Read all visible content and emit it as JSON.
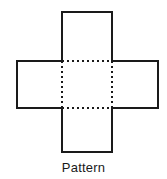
{
  "figure": {
    "title": "Pattern",
    "colors": {
      "background": "#ffffff",
      "outline": "#1a1a1a",
      "dashed": "#1a1a1a",
      "face_fill": "#ffffff",
      "caption_text": "#1a1a1a"
    },
    "stroke": {
      "outline_width": 2,
      "dashed_width": 2,
      "dash_pattern": "2 3"
    },
    "geometry": {
      "top_square": {
        "x": 62,
        "y": 12,
        "width": 50,
        "height": 49
      },
      "left_square": {
        "x": 17,
        "y": 61,
        "width": 45,
        "height": 47
      },
      "center_square": {
        "x": 62,
        "y": 61,
        "width": 50,
        "height": 47
      },
      "right_square": {
        "x": 112,
        "y": 61,
        "width": 46,
        "height": 47
      },
      "bottom_square": {
        "x": 62,
        "y": 108,
        "width": 50,
        "height": 44
      }
    },
    "outline_path": "M 62 12 L 112 12 L 112 61 L 158 61 L 158 108 L 112 108 L 112 152 L 62 152 L 62 108 L 17 108 L 17 61 L 62 61 Z",
    "dashed_segments": [
      {
        "name": "center-top-fold",
        "x1": 62,
        "y1": 61,
        "x2": 112,
        "y2": 61
      },
      {
        "name": "center-bottom-fold",
        "x1": 62,
        "y1": 108,
        "x2": 112,
        "y2": 108
      },
      {
        "name": "center-left-fold",
        "x1": 62,
        "y1": 61,
        "x2": 62,
        "y2": 108
      },
      {
        "name": "center-right-fold",
        "x1": 112,
        "y1": 61,
        "x2": 112,
        "y2": 108
      }
    ]
  },
  "caption": {
    "label": "Pattern"
  }
}
